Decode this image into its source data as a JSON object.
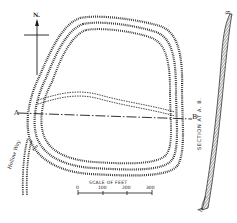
{
  "figure": {
    "type": "earthwork plan",
    "ink_color": "#1a1a1a",
    "background_color": "#ffffff"
  },
  "north_arrow": {
    "label": "N."
  },
  "section_line": {
    "start_label": "A",
    "end_label": "B"
  },
  "road": {
    "label": "Hollow Way"
  },
  "scale_bar": {
    "title": "SCALE OF FEET",
    "ticks": [
      "0",
      "100",
      "200",
      "300"
    ]
  },
  "section_profile": {
    "title": "SECTION AT A. B.",
    "start_label": "A",
    "end_label": "B"
  }
}
